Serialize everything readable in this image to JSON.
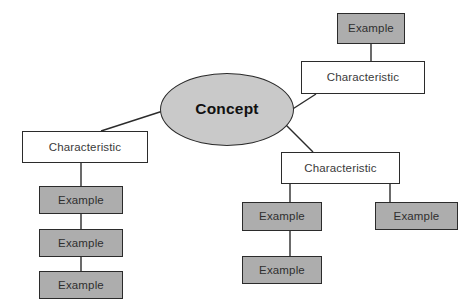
{
  "diagram": {
    "type": "concept-map",
    "background_color": "#ffffff",
    "palette": {
      "concept_fill": "#c9c9c9",
      "characteristic_fill": "#ffffff",
      "example_fill": "#adadad",
      "stroke": "#2b2b2b",
      "text": "#3a3a3a",
      "concept_text": "#111111"
    },
    "nodes": [
      {
        "id": "concept",
        "label": "Concept",
        "shape": "ellipse",
        "fill": "#c9c9c9",
        "x": 160,
        "y": 73,
        "w": 134,
        "h": 73
      },
      {
        "id": "characteristic-top-right",
        "label": "Characteristic",
        "shape": "rect",
        "fill": "#ffffff",
        "x": 301,
        "y": 61,
        "w": 124,
        "h": 33
      },
      {
        "id": "example-top-right",
        "label": "Example",
        "shape": "rect",
        "fill": "#adadad",
        "x": 337,
        "y": 13,
        "w": 68,
        "h": 31
      },
      {
        "id": "characteristic-left",
        "label": "Characteristic",
        "shape": "rect",
        "fill": "#ffffff",
        "x": 22,
        "y": 131,
        "w": 126,
        "h": 32
      },
      {
        "id": "example-left-1",
        "label": "Example",
        "shape": "rect",
        "fill": "#adadad",
        "x": 39,
        "y": 186,
        "w": 84,
        "h": 28
      },
      {
        "id": "example-left-2",
        "label": "Example",
        "shape": "rect",
        "fill": "#adadad",
        "x": 39,
        "y": 229,
        "w": 84,
        "h": 28
      },
      {
        "id": "example-left-3",
        "label": "Example",
        "shape": "rect",
        "fill": "#adadad",
        "x": 39,
        "y": 271,
        "w": 84,
        "h": 28
      },
      {
        "id": "characteristic-right",
        "label": "Characteristic",
        "shape": "rect",
        "fill": "#ffffff",
        "x": 281,
        "y": 152,
        "w": 119,
        "h": 32
      },
      {
        "id": "example-right-a",
        "label": "Example",
        "shape": "rect",
        "fill": "#adadad",
        "x": 242,
        "y": 202,
        "w": 80,
        "h": 29
      },
      {
        "id": "example-right-b",
        "label": "Example",
        "shape": "rect",
        "fill": "#adadad",
        "x": 375,
        "y": 202,
        "w": 83,
        "h": 28
      },
      {
        "id": "example-right-c",
        "label": "Example",
        "shape": "rect",
        "fill": "#adadad",
        "x": 242,
        "y": 256,
        "w": 80,
        "h": 28
      }
    ],
    "edges": [
      {
        "from": "concept",
        "to": "characteristic-left",
        "kind": "diagonal"
      },
      {
        "from": "concept",
        "to": "characteristic-top-right",
        "kind": "diagonal"
      },
      {
        "from": "concept",
        "to": "characteristic-right",
        "kind": "diagonal"
      },
      {
        "from": "characteristic-top-right",
        "to": "example-top-right",
        "kind": "vertical"
      },
      {
        "from": "characteristic-left",
        "to": "example-left-1",
        "kind": "vertical"
      },
      {
        "from": "example-left-1",
        "to": "example-left-2",
        "kind": "vertical"
      },
      {
        "from": "example-left-2",
        "to": "example-left-3",
        "kind": "vertical"
      },
      {
        "from": "characteristic-right",
        "to": "example-right-a",
        "kind": "vertical"
      },
      {
        "from": "characteristic-right",
        "to": "example-right-b",
        "kind": "vertical"
      },
      {
        "from": "example-right-a",
        "to": "example-right-c",
        "kind": "vertical"
      }
    ]
  },
  "labels": {
    "concept": "Concept",
    "characteristic_top_right": "Characteristic",
    "characteristic_left": "Characteristic",
    "characteristic_right": "Characteristic",
    "example_top_right": "Example",
    "example_left_1": "Example",
    "example_left_2": "Example",
    "example_left_3": "Example",
    "example_right_a": "Example",
    "example_right_b": "Example",
    "example_right_c": "Example"
  }
}
